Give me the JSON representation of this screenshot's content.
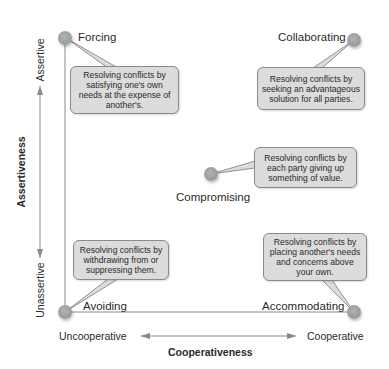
{
  "diagram": {
    "x_axis": {
      "title": "Cooperativeness",
      "low_label": "Uncooperative",
      "high_label": "Cooperative"
    },
    "y_axis": {
      "title": "Assertiveness",
      "low_label": "Unassertive",
      "high_label": "Assertive"
    },
    "styles": [
      {
        "name": "Forcing",
        "description": "Resolving conflicts by satisfying one's own needs at the expense of another's.",
        "position": "top-left"
      },
      {
        "name": "Collaborating",
        "description": "Resolving conflicts by seeking an advantageous solution for all parties.",
        "position": "top-right"
      },
      {
        "name": "Compromising",
        "description": "Resolving conflicts by each party giving up something of value.",
        "position": "center"
      },
      {
        "name": "Avoiding",
        "description": "Resolving conflicts by withdrawing from or suppressing them.",
        "position": "bottom-left"
      },
      {
        "name": "Accommodating",
        "description": "Resolving conflicts by placing another's needs and concerns above your own.",
        "position": "bottom-right"
      }
    ],
    "colors": {
      "node": "#9c9c9c",
      "callout_fill": "#dcdcdc",
      "callout_border": "#8a8a8a",
      "axis_line": "#8a8a8a"
    }
  }
}
